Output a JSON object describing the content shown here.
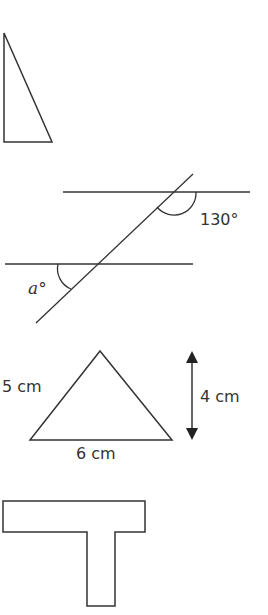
{
  "figures": {
    "right_triangle": {
      "label": "right-angled triangle"
    },
    "parallel_lines": {
      "given_angle": "130°",
      "unknown_angle": "a°"
    },
    "isosceles_triangle": {
      "side_label": "5 cm",
      "base_label": "6 cm",
      "height_label": "4 cm"
    },
    "t_shape": {
      "label": "T-shaped compound shape"
    }
  },
  "colors": {
    "stroke": "#333333",
    "background": "#ffffff"
  }
}
